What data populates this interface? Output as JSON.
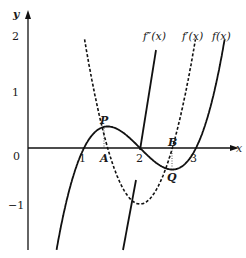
{
  "diagram": {
    "axes": {
      "x_label": "x",
      "y_label": "y",
      "origin_label": "0"
    },
    "x_ticks": [
      "1",
      "2",
      "3"
    ],
    "y_ticks": [
      "2",
      "1",
      "−1"
    ],
    "curves": [
      {
        "name": "f(x)",
        "label": "f(x)",
        "style": "solid",
        "expression": "(x-1)(x-2)(x-3)"
      },
      {
        "name": "f'(x)",
        "label": "f′(x)",
        "style": "dashed",
        "expression": "3x^2-12x+11"
      },
      {
        "name": "f''(x)",
        "label": "f″(x)",
        "style": "solid",
        "expression": "6x-12"
      }
    ],
    "points": {
      "P": "P",
      "Q": "Q",
      "A": "A",
      "B": "B"
    }
  }
}
